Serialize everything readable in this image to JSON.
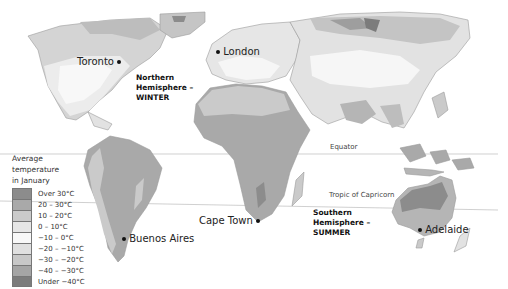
{
  "map": {
    "title": "Average temperature in January",
    "legend": {
      "title_lines": [
        "Average",
        "temperature",
        "in January"
      ],
      "items": [
        {
          "label": "Over 30°C",
          "color": "#8c8c8c"
        },
        {
          "label": "20 – 30°C",
          "color": "#a9a9a9"
        },
        {
          "label": "10 – 20°C",
          "color": "#cacaca"
        },
        {
          "label": "0 – 10°C",
          "color": "#e6e6e6"
        },
        {
          "label": "−10 – 0°C",
          "color": "#f8f8f8"
        },
        {
          "label": "−20 – −10°C",
          "color": "#e0e0e0"
        },
        {
          "label": "−30 – −20°C",
          "color": "#c8c8c8"
        },
        {
          "label": "−40 – −30°C",
          "color": "#a5a5a5"
        },
        {
          "label": "Under −40°C",
          "color": "#7c7c7c"
        }
      ]
    },
    "cities": [
      {
        "name": "Toronto",
        "dot_side": "right"
      },
      {
        "name": "London",
        "dot_side": "left"
      },
      {
        "name": "Cape Town",
        "dot_side": "right"
      },
      {
        "name": "Buenos Aires",
        "dot_side": "left"
      },
      {
        "name": "Adelaide",
        "dot_side": "left"
      }
    ],
    "hemispheres": {
      "north": {
        "lines": [
          "Northern",
          "Hemisphere –",
          "WINTER"
        ]
      },
      "south": {
        "lines": [
          "Southern",
          "Hemisphere –",
          "SUMMER"
        ]
      }
    },
    "reference_lines": {
      "equator": "Equator",
      "tropic_capricorn": "Tropic of Capricorn"
    }
  }
}
